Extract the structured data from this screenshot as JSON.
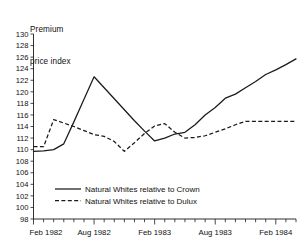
{
  "chart_data": {
    "type": "line",
    "title": "Premium price index",
    "title_line1": "Premium",
    "title_line2": "price index",
    "xlabel": "",
    "ylabel": "Premium price index",
    "ylim": [
      98,
      130
    ],
    "ytick_step": 2,
    "yticks": [
      130,
      128,
      126,
      124,
      122,
      120,
      118,
      116,
      114,
      112,
      110,
      108,
      106,
      104,
      102,
      100,
      98
    ],
    "ytick_labels": [
      "130",
      "128",
      "126",
      "124",
      "122",
      "120",
      "118",
      "116",
      "114",
      "112",
      "110",
      "108",
      "106",
      "104",
      "102",
      "100",
      "98"
    ],
    "xticks_labeled": [
      "Feb 1982",
      "Aug 1982",
      "Feb 1983",
      "Aug 1983",
      "Feb 1984"
    ],
    "xtick_positions_months": [
      0,
      6,
      12,
      18,
      24
    ],
    "xtick_interval": "monthly minor ticks, 6-month major ticks",
    "x": [
      "Feb 1982",
      "Mar 1982",
      "Apr 1982",
      "May 1982",
      "Jun 1982",
      "Jul 1982",
      "Aug 1982",
      "Sep 1982",
      "Oct 1982",
      "Nov 1982",
      "Dec 1982",
      "Jan 1983",
      "Feb 1983",
      "Mar 1983",
      "Apr 1983",
      "May 1983",
      "Jun 1983",
      "Jul 1983",
      "Aug 1983",
      "Sep 1983",
      "Oct 1983",
      "Nov 1983",
      "Dec 1983",
      "Jan 1984",
      "Feb 1984",
      "Mar 1984",
      "Apr 1984"
    ],
    "grid": false,
    "legend_position": "lower-left inside plot",
    "series": [
      {
        "name": "Natural Whites relative to Crown",
        "style": "solid",
        "color": "#1a1a1a",
        "values": [
          109.7,
          109.8,
          110.0,
          111.0,
          114.8,
          118.7,
          122.6,
          120.7,
          118.8,
          116.9,
          115.0,
          113.2,
          111.5,
          112.0,
          112.7,
          113.0,
          114.3,
          116.0,
          117.3,
          118.9,
          119.6,
          120.7,
          121.8,
          123.0,
          123.8,
          124.7,
          125.7
        ]
      },
      {
        "name": "Natural Whites relative to Dulux",
        "style": "dashed",
        "color": "#1a1a1a",
        "values": [
          110.5,
          110.5,
          115.2,
          114.6,
          114.0,
          113.3,
          112.6,
          112.3,
          111.4,
          109.7,
          111.2,
          112.8,
          114.1,
          114.5,
          113.0,
          112.0,
          112.1,
          112.4,
          113.0,
          113.6,
          114.3,
          114.9,
          114.9,
          114.9,
          114.9,
          114.9,
          114.9
        ]
      }
    ],
    "annotations": []
  },
  "legend": {
    "items": [
      {
        "label": "Natural Whites relative to Crown",
        "style": "solid"
      },
      {
        "label": "Natural Whites relative to Dulux",
        "style": "dashed"
      }
    ]
  }
}
